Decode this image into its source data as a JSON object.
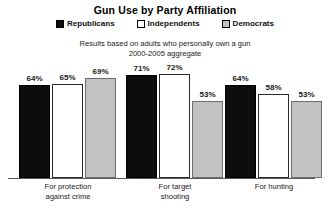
{
  "chart_data": {
    "type": "bar",
    "title": "Gun Use by Party Affiliation",
    "subtitle_line1": "Results based on adults who personally own a gun",
    "subtitle_line2": "2000-2005 aggregate",
    "xlabel": "",
    "ylabel": "",
    "ylim": [
      0,
      80
    ],
    "grid": false,
    "legend_position": "top-center",
    "value_suffix": "%",
    "categories": [
      "For protection against crime",
      "For target shooting",
      "For hunting"
    ],
    "category_lines": [
      [
        "For protection",
        "against crime"
      ],
      [
        "For target",
        "shooting"
      ],
      [
        "For hunting"
      ]
    ],
    "series": [
      {
        "name": "Republicans",
        "color": "#0d0d0d",
        "values": [
          64,
          71,
          64
        ],
        "labels": [
          "64%",
          "71%",
          "64%"
        ]
      },
      {
        "name": "Independents",
        "color": "#ffffff",
        "values": [
          65,
          72,
          58
        ],
        "labels": [
          "65%",
          "72%",
          "58%"
        ]
      },
      {
        "name": "Democrats",
        "color": "#c2c2c2",
        "values": [
          69,
          53,
          53
        ],
        "labels": [
          "69%",
          "53%",
          "53%"
        ]
      }
    ]
  }
}
